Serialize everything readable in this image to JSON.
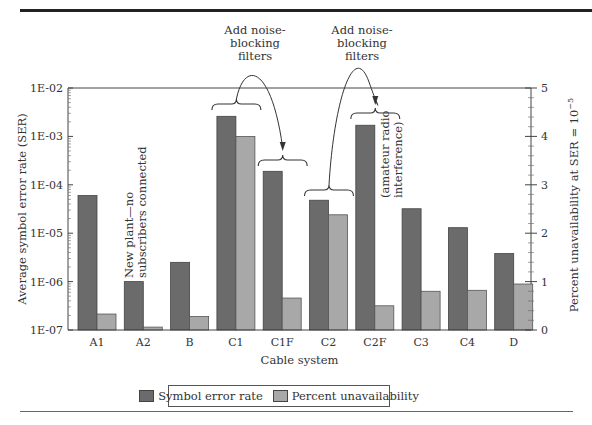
{
  "chart_data": {
    "type": "bar",
    "title": "",
    "xlabel": "Cable system",
    "ylabel": "Average symbol error rate (SER)",
    "ylabel_right": "Percent unavailability at SER = 10^-5",
    "y_scale": "log",
    "ylim": [
      1e-07,
      0.01
    ],
    "ylim_right": [
      0,
      5
    ],
    "y_ticks": [
      "1E-02",
      "1E-03",
      "1E-04",
      "1E-05",
      "1E-06",
      "1E-07"
    ],
    "y_ticks_right": [
      "5",
      "4",
      "3",
      "2",
      "1",
      "0"
    ],
    "categories": [
      "A1",
      "A2",
      "B",
      "C1",
      "C1F",
      "C2",
      "C2F",
      "C3",
      "C4",
      "D"
    ],
    "series": [
      {
        "name": "Symbol error rate",
        "axis": "left",
        "color": "#6b6b6b",
        "values": [
          6e-05,
          1e-06,
          2.5e-06,
          0.0026,
          0.00019,
          4.8e-05,
          0.0017,
          3.2e-05,
          1.3e-05,
          3.8e-06
        ]
      },
      {
        "name": "Percent unavailability",
        "axis": "right",
        "color": "#a8a8a8",
        "values": [
          0.33,
          0.06,
          0.28,
          4.0,
          0.66,
          2.38,
          0.5,
          0.8,
          0.82,
          0.95
        ]
      }
    ],
    "annotations": [
      {
        "text": [
          "Add noise-",
          "blocking",
          "filters"
        ],
        "from": "C1",
        "to": "C1F"
      },
      {
        "text": [
          "Add noise-",
          "blocking",
          "filters"
        ],
        "from": "C2",
        "to": "C2F"
      },
      {
        "text": [
          "New plant—no",
          "subscribers connected"
        ],
        "near": "A2",
        "rotated": true
      },
      {
        "text": [
          "(amateur radio",
          "interference)"
        ],
        "near": "C2F",
        "rotated": true
      }
    ],
    "legend_position": "bottom",
    "grid": false
  },
  "legend": {
    "items": [
      {
        "label": "Symbol error rate",
        "color": "#6b6b6b"
      },
      {
        "label": "Percent unavailability",
        "color": "#a8a8a8"
      }
    ]
  }
}
